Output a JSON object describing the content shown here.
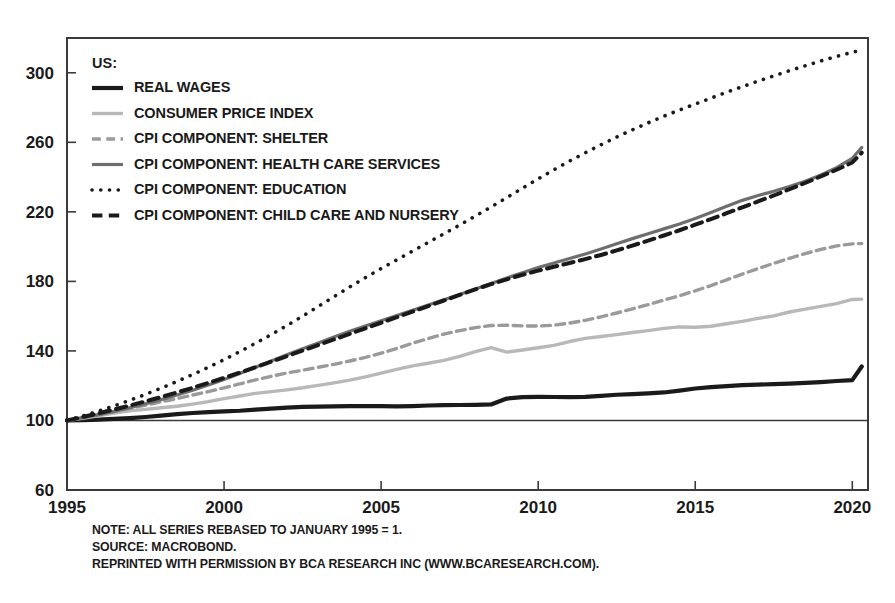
{
  "chart_data": {
    "type": "line",
    "title": "",
    "subtitle": "",
    "xlabel": "",
    "ylabel": "",
    "legend_position": "top-left",
    "legend_title": "US:",
    "grid": false,
    "xlim": [
      1995,
      2020.5
    ],
    "ylim": [
      60,
      320
    ],
    "y_ticks": [
      60,
      100,
      140,
      180,
      220,
      260,
      300
    ],
    "x_ticks": [
      1995,
      2000,
      2005,
      2010,
      2015,
      2020
    ],
    "baseline_value": 100,
    "x": [
      1995,
      1995.5,
      1996,
      1996.5,
      1997,
      1997.5,
      1998,
      1998.5,
      1999,
      1999.5,
      2000,
      2000.5,
      2001,
      2001.5,
      2002,
      2002.5,
      2003,
      2003.5,
      2004,
      2004.5,
      2005,
      2005.5,
      2006,
      2006.5,
      2007,
      2007.5,
      2008,
      2008.5,
      2009,
      2009.5,
      2010,
      2010.5,
      2011,
      2011.5,
      2012,
      2012.5,
      2013,
      2013.5,
      2014,
      2014.5,
      2015,
      2015.5,
      2016,
      2016.5,
      2017,
      2017.5,
      2018,
      2018.5,
      2019,
      2019.5,
      2020,
      2020.3
    ],
    "series": [
      {
        "name": "REAL WAGES",
        "style": "solid",
        "color": "#1a1a1a",
        "width": 4.2,
        "values": [
          100,
          100.2,
          100.5,
          100.9,
          101.4,
          102.0,
          102.8,
          103.6,
          104.3,
          104.8,
          105.2,
          105.6,
          106.2,
          106.8,
          107.4,
          107.8,
          108.0,
          108.1,
          108.2,
          108.3,
          108.2,
          108.1,
          108.3,
          108.6,
          108.8,
          108.9,
          109.0,
          109.2,
          112.6,
          113.4,
          113.6,
          113.5,
          113.4,
          113.6,
          114.2,
          114.8,
          115.2,
          115.6,
          116.1,
          117.2,
          118.4,
          119.2,
          119.8,
          120.3,
          120.6,
          120.9,
          121.2,
          121.6,
          122.1,
          122.7,
          123.2,
          131.0
        ]
      },
      {
        "name": "CONSUMER PRICE INDEX",
        "style": "solid",
        "color": "#b8b8b8",
        "width": 3.4,
        "values": [
          100,
          101.3,
          102.7,
          104.2,
          105.5,
          106.4,
          107.3,
          108.2,
          109.4,
          110.8,
          112.6,
          114.1,
          115.6,
          116.6,
          117.6,
          118.8,
          120.2,
          121.6,
          123.2,
          125.1,
          127.2,
          129.4,
          131.4,
          132.9,
          134.6,
          136.9,
          139.6,
          141.9,
          139.3,
          140.5,
          141.8,
          143.2,
          145.4,
          147.2,
          148.3,
          149.4,
          150.6,
          151.7,
          153.0,
          153.8,
          153.6,
          154.2,
          155.6,
          157.0,
          158.7,
          160.2,
          162.4,
          164.0,
          165.6,
          167.2,
          169.6,
          169.8
        ]
      },
      {
        "name": "CPI COMPONENT: SHELTER",
        "style": "dashed",
        "color": "#9a9a9a",
        "width": 3.4,
        "values": [
          100,
          101.6,
          103.3,
          105.1,
          107.0,
          108.8,
          110.7,
          112.6,
          114.6,
          116.6,
          118.8,
          121.0,
          123.3,
          125.4,
          127.3,
          128.9,
          130.6,
          132.3,
          134.2,
          136.3,
          138.7,
          141.4,
          144.4,
          147.1,
          149.7,
          151.7,
          153.4,
          154.6,
          154.8,
          154.4,
          154.3,
          154.8,
          156.0,
          157.6,
          159.6,
          161.8,
          164.2,
          166.6,
          169.2,
          171.8,
          174.6,
          177.6,
          180.9,
          184.2,
          187.4,
          190.4,
          193.3,
          196.0,
          198.4,
          200.4,
          201.6,
          201.8
        ]
      },
      {
        "name": "CPI COMPONENT: HEALTH CARE SERVICES",
        "style": "solid",
        "color": "#6e6e6e",
        "width": 3.2,
        "values": [
          100,
          101.6,
          103.3,
          105.2,
          107.3,
          109.6,
          112.0,
          114.6,
          117.4,
          120.4,
          123.6,
          127.0,
          130.6,
          134.2,
          137.8,
          141.2,
          144.6,
          148.0,
          151.3,
          154.4,
          157.4,
          160.4,
          163.4,
          166.4,
          169.4,
          172.4,
          175.6,
          178.8,
          182.0,
          185.0,
          188.0,
          190.6,
          193.2,
          195.8,
          198.6,
          201.6,
          204.6,
          207.4,
          210.2,
          213.0,
          216.2,
          219.6,
          223.2,
          226.6,
          229.4,
          231.8,
          234.6,
          237.6,
          241.2,
          245.4,
          250.8,
          257.0
        ]
      },
      {
        "name": "CPI COMPONENT: EDUCATION",
        "style": "dotted",
        "color": "#1a1a1a",
        "width": 3.6,
        "values": [
          100,
          102.6,
          105.4,
          108.4,
          111.6,
          115.0,
          118.6,
          122.4,
          126.4,
          130.6,
          135.0,
          139.6,
          144.4,
          149.4,
          154.6,
          160.0,
          165.6,
          171.2,
          176.8,
          182.2,
          187.4,
          192.4,
          197.4,
          202.4,
          207.4,
          212.4,
          217.6,
          222.8,
          228.2,
          233.6,
          239.0,
          244.2,
          249.2,
          254.0,
          258.6,
          263.0,
          267.2,
          271.2,
          275.0,
          278.6,
          282.0,
          285.4,
          288.8,
          292.0,
          295.2,
          298.2,
          301.2,
          304.0,
          306.8,
          309.4,
          311.8,
          313.0
        ]
      },
      {
        "name": "CPI COMPONENT: CHILD CARE AND NURSERY",
        "style": "dashed",
        "color": "#1a1a1a",
        "width": 4.0,
        "values": [
          100,
          102.0,
          104.1,
          106.3,
          108.6,
          111.0,
          113.5,
          116.1,
          118.8,
          121.6,
          124.5,
          127.5,
          130.6,
          133.8,
          137.0,
          140.2,
          143.4,
          146.6,
          149.8,
          153.0,
          156.2,
          159.4,
          162.6,
          165.8,
          169.0,
          172.2,
          175.4,
          178.4,
          181.2,
          183.8,
          186.2,
          188.4,
          190.6,
          192.8,
          195.2,
          197.8,
          200.6,
          203.4,
          206.4,
          209.4,
          212.6,
          215.8,
          219.2,
          222.6,
          226.0,
          229.4,
          233.0,
          236.6,
          240.4,
          244.2,
          248.4,
          254.0
        ]
      }
    ]
  },
  "legend": {
    "title": "US:",
    "items": [
      {
        "label": "REAL WAGES"
      },
      {
        "label": "CONSUMER PRICE INDEX"
      },
      {
        "label": "CPI COMPONENT: SHELTER"
      },
      {
        "label": "CPI COMPONENT: HEALTH CARE SERVICES"
      },
      {
        "label": "CPI COMPONENT: EDUCATION"
      },
      {
        "label": "CPI COMPONENT: CHILD CARE AND NURSERY"
      }
    ]
  },
  "footnotes": [
    "NOTE: ALL SERIES REBASED TO JANUARY 1995 = 1.",
    "SOURCE: MACROBOND.",
    "REPRINTED WITH PERMISSION BY BCA RESEARCH INC (WWW.BCARESEARCH.COM)."
  ]
}
